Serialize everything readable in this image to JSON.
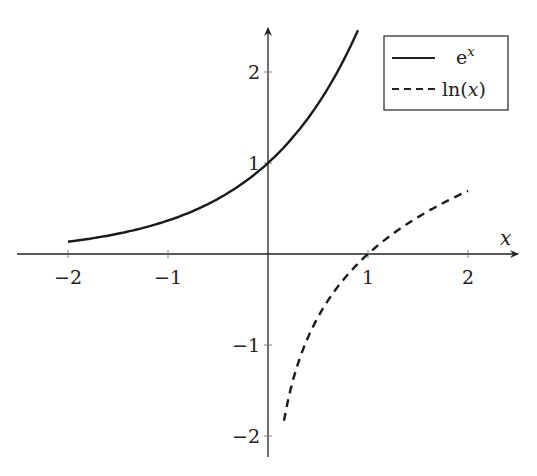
{
  "chart_data": {
    "type": "line",
    "title": "",
    "xlabel": "x",
    "ylabel": "",
    "xlim": [
      -2.5,
      2.5
    ],
    "ylim": [
      -2.2,
      2.5
    ],
    "grid": false,
    "legend_position": "upper right",
    "x_ticks": [
      "−2",
      "−1",
      "1",
      "2"
    ],
    "y_ticks": [
      "2",
      "1",
      "−1",
      "−2"
    ],
    "series": [
      {
        "name": "e^x",
        "style": "solid",
        "x": [
          -2,
          -1.5,
          -1,
          -0.5,
          0,
          0.5,
          0.9
        ],
        "values": [
          0.14,
          0.22,
          0.37,
          0.61,
          1.0,
          1.65,
          2.46
        ]
      },
      {
        "name": "ln(x)",
        "style": "dashed",
        "x": [
          0.16,
          0.25,
          0.5,
          1,
          1.5,
          2
        ],
        "values": [
          -1.83,
          -1.39,
          -0.69,
          0,
          0.41,
          0.69
        ]
      }
    ]
  },
  "legend": {
    "items": [
      {
        "label": "e",
        "sup": "x"
      },
      {
        "label": "ln(",
        "var": "x",
        "close": ")"
      }
    ]
  },
  "axes": {
    "x_label": "x"
  }
}
